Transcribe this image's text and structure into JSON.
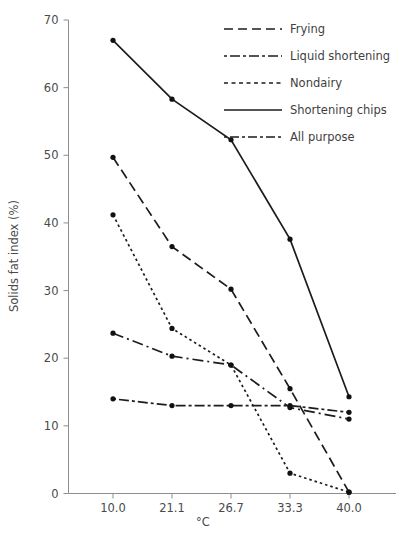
{
  "chart_data": {
    "type": "line",
    "title": "",
    "xlabel": "°C",
    "ylabel": "Solids fat index (%)",
    "x": [
      10.0,
      21.1,
      26.7,
      33.3,
      40.0
    ],
    "xtick_labels": [
      "10.0",
      "21.1",
      "26.7",
      "33.3",
      "40.0"
    ],
    "ytick_labels": [
      "0",
      "10",
      "20",
      "30",
      "40",
      "50",
      "60",
      "70"
    ],
    "ytick_values": [
      0,
      10,
      20,
      30,
      40,
      50,
      60,
      70
    ],
    "ylim": [
      0,
      70
    ],
    "xlim_index": [
      0,
      4
    ],
    "grid": false,
    "legend_position": "top-right",
    "marker": "filled-circle",
    "series": [
      {
        "name": "Frying",
        "values": [
          49.7,
          36.5,
          30.2,
          15.5,
          0.2
        ],
        "dash": "10,5",
        "legend_dash": "9,5"
      },
      {
        "name": "Liquid shortening",
        "values": [
          23.7,
          20.3,
          19.0,
          12.7,
          11.0
        ],
        "dash": "11,4,2,4",
        "legend_dash": "3,3,10,3"
      },
      {
        "name": "Nondairy",
        "values": [
          41.2,
          24.4,
          19.0,
          3.0,
          0.2
        ],
        "dash": "2.5,3",
        "legend_dash": "4,3.5"
      },
      {
        "name": "Shortening chips",
        "values": [
          67.0,
          58.3,
          52.3,
          37.6,
          14.3
        ],
        "dash": "none",
        "legend_dash": "none"
      },
      {
        "name": "All purpose",
        "values": [
          14.0,
          13.0,
          13.0,
          13.0,
          12.0
        ],
        "dash": "3,3,10,3",
        "legend_dash": "3,3,9,3"
      }
    ]
  },
  "axes": {
    "y_title": "Solids fat index (%)",
    "x_title": "°C"
  },
  "legend": {
    "entries": [
      {
        "label": "Frying"
      },
      {
        "label": "Liquid shortening"
      },
      {
        "label": "Nondairy"
      },
      {
        "label": "Shortening chips"
      },
      {
        "label": "All purpose"
      }
    ]
  }
}
